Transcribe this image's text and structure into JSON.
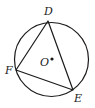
{
  "diagram": {
    "type": "inscribed-triangle-in-circle",
    "circle": {
      "center_label": "O",
      "cx": 51.5,
      "cy": 59.5,
      "r": 37
    },
    "points": {
      "D": {
        "label": "D",
        "x": 48,
        "y": 21
      },
      "E": {
        "label": "E",
        "x": 73,
        "y": 90
      },
      "F": {
        "label": "F",
        "x": 16,
        "y": 70
      }
    },
    "center_point": {
      "label": "O",
      "x": 52,
      "y": 59
    },
    "colors": {
      "stroke": "#1a1a1a",
      "background": "#ffffff"
    }
  }
}
